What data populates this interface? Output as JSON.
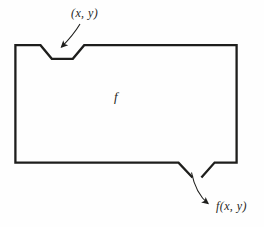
{
  "diagram": {
    "kind": "function-machine",
    "labels": {
      "input": "(x, y)",
      "function": "f",
      "output": "f(x, y)"
    },
    "colors": {
      "line": "#1e1e1c",
      "text": "#262622",
      "background": "#fefefe"
    }
  }
}
